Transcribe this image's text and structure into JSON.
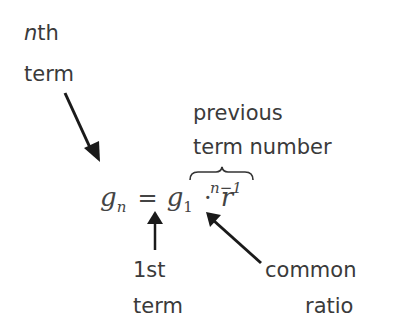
{
  "diagram": {
    "type": "annotated-formula",
    "formula": {
      "lhs_var": "g",
      "lhs_sub": "n",
      "equals": "=",
      "first_var": "g",
      "first_sub": "1",
      "dot": "·",
      "ratio_var": "r",
      "exponent": "n−1"
    },
    "labels": {
      "nth_term": {
        "italic_part": "n",
        "rest": "th",
        "line2": "term"
      },
      "previous_term_number": {
        "line1": "previous",
        "line2": "term number"
      },
      "first_term": {
        "line1": "1st",
        "line2": "term"
      },
      "common_ratio": {
        "line1": "common",
        "line2": "ratio"
      }
    },
    "colors": {
      "text": "#3a3a3a",
      "arrow": "#1a1a1a",
      "background": "#ffffff"
    }
  }
}
